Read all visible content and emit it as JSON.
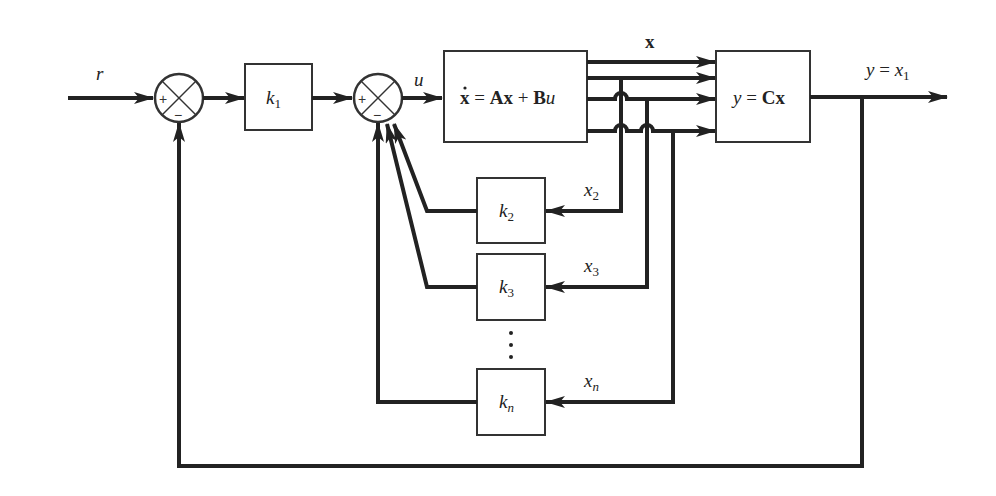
{
  "diagram": {
    "type": "state-feedback block diagram",
    "colors": {
      "line": "#222222",
      "box": "#333333",
      "background": "#ffffff"
    },
    "signals": {
      "input": "r",
      "control": "u",
      "state_vector": "x",
      "output": {
        "lhs": "y",
        "eq": " = ",
        "rhs": "x",
        "rhs_sub": "1"
      }
    },
    "summing_junctions": [
      {
        "id": "sum1",
        "signs": {
          "left": "+",
          "bottom": "−"
        }
      },
      {
        "id": "sum2",
        "signs": {
          "left": "+",
          "bottom": "−"
        }
      }
    ],
    "blocks": {
      "k1": {
        "base": "k",
        "sub": "1"
      },
      "plant": {
        "xdot": "x",
        "eq": " = ",
        "A": "A",
        "x1": "x",
        "plus": " + ",
        "B": "B",
        "u": "u"
      },
      "output_block": {
        "y": "y",
        "eq": " = ",
        "C": "C",
        "x": "x"
      },
      "k2": {
        "base": "k",
        "sub": "2"
      },
      "k3": {
        "base": "k",
        "sub": "3"
      },
      "kn": {
        "base": "k",
        "sub": "n"
      }
    },
    "feedback_labels": [
      {
        "base": "x",
        "sub": "2"
      },
      {
        "base": "x",
        "sub": "3"
      },
      {
        "base": "x",
        "sub": "n"
      }
    ],
    "ellipsis": "⋮"
  }
}
